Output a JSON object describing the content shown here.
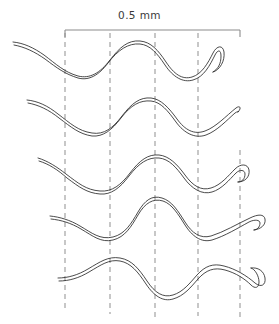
{
  "figure": {
    "name": "undulating-filament-sequence",
    "background_color": "#ffffff",
    "width": 279,
    "height": 324,
    "scale_bar": {
      "label": "0.5 mm",
      "x_start": 65,
      "x_end": 240,
      "y": 30,
      "tick_length": 7,
      "color": "#8c8c8c",
      "label_color": "#3a3a3a"
    },
    "reference_lines": {
      "style": "dashed",
      "color": "#9a9a9a",
      "stroke_width": 1.1,
      "dash_pattern": "5,4",
      "lines": [
        {
          "name": "reference-line-1",
          "x": 65,
          "y_top": 33,
          "y_bottom": 308
        },
        {
          "name": "reference-line-2",
          "x": 110,
          "y_top": 33,
          "y_bottom": 314
        },
        {
          "name": "reference-line-3",
          "x": 155,
          "y_top": 33,
          "y_bottom": 318
        },
        {
          "name": "reference-line-4",
          "x": 198,
          "y_top": 33,
          "y_bottom": 316
        },
        {
          "name": "reference-line-5",
          "x": 240,
          "y_top": 150,
          "y_bottom": 320
        }
      ]
    },
    "filaments": {
      "stroke_color": "#2b2b2b",
      "stroke_width": 0.85,
      "count": 5,
      "description": "Five successive body postures of an undulating filament, each drawn as a double-outline ribbon with a tapered head at left and a hooked tail at right.",
      "rows": [
        {
          "name": "filament-row-1",
          "head_x": 13,
          "head_y": 42,
          "tail_x": 222,
          "tail_y": 70,
          "outer": "M13,42 C24,43 34,48 44,55 C56,64 64,72 78,76 C90,79 100,73 110,60 C120,47 128,40 140,41 C151,42 158,50 166,62 C174,74 182,80 192,77 C202,74 208,63 213,53 C217,45 223,45 224,52 C225,61 220,70 213,72",
          "inner": "M14,45 C25,47 35,52 45,59 C57,68 65,74 78,78 C89,81 99,75 108,63 C118,50 128,43 140,44 C150,45 157,53 165,65 C173,77 183,83 193,80 C204,77 210,65 215,55 C218,49 221,50 221,56 C221,64 218,69 213,72"
        },
        {
          "name": "filament-row-2",
          "head_x": 27,
          "head_y": 100,
          "tail_x": 238,
          "tail_y": 111,
          "outer": "M27,100 C38,101 48,106 58,114 C70,123 78,131 92,133 C104,135 113,128 122,116 C132,103 140,97 151,98 C161,99 169,108 177,119 C185,130 194,135 205,131 C216,127 226,116 236,108 C240,105 242,108 238,112",
          "inner": "M28,103 C39,105 49,110 59,118 C71,127 79,134 92,136 C103,137 112,130 121,118 C131,105 140,100 151,101 C161,102 168,111 176,122 C184,133 195,139 206,135 C217,131 227,120 235,113 C238,111 240,111 238,112"
        },
        {
          "name": "filament-row-3",
          "head_x": 38,
          "head_y": 158,
          "tail_x": 248,
          "tail_y": 172,
          "outer": "M38,158 C48,161 57,167 66,174 C78,183 86,190 100,191 C112,192 121,185 130,173 C140,160 148,154 159,155 C169,156 177,164 185,175 C193,186 201,191 211,188 C221,185 228,176 235,169 C241,163 248,164 249,170 C250,177 245,182 238,182",
          "inner": "M39,161 C49,164 58,170 67,178 C79,187 87,193 100,194 C111,195 120,188 129,176 C139,163 148,157 159,158 C169,159 176,167 184,178 C192,189 202,195 212,192 C222,189 229,180 236,173 C240,169 245,170 245,174 C245,179 242,182 238,182"
        },
        {
          "name": "filament-row-4",
          "head_x": 50,
          "head_y": 216,
          "tail_x": 266,
          "tail_y": 220,
          "outer": "M50,216 C60,217 70,220 80,226 C92,233 100,240 113,237 C125,234 131,224 138,212 C145,200 152,195 162,198 C172,201 178,211 185,222 C192,233 200,239 211,236 C224,232 237,224 250,218 C258,214 264,214 265,219 C266,225 261,229 254,230",
          "inner": "M51,219 C61,220 71,223 81,229 C93,236 101,243 113,240 C125,237 131,227 138,215 C145,203 153,198 163,201 C172,204 178,214 185,225 C192,236 201,243 212,240 C225,236 238,228 249,222 C255,219 260,220 260,223 C260,227 257,230 254,230"
        },
        {
          "name": "filament-row-5",
          "head_x": 58,
          "head_y": 278,
          "tail_x": 264,
          "tail_y": 275,
          "outer": "M58,278 C68,278 78,275 88,269 C100,262 108,256 120,258 C132,260 139,269 147,281 C155,293 163,298 173,295 C183,292 190,283 197,275 C205,266 213,263 224,266 C236,269 247,276 255,283 C261,288 266,285 265,278 C264,271 258,267 251,268",
          "inner": "M59,281 C69,281 79,278 89,272 C101,265 109,259 120,261 C131,263 138,272 146,284 C154,296 163,302 173,299 C184,296 191,287 198,279 C206,270 214,267 225,270 C236,273 245,279 251,285 C255,289 259,288 259,282 C259,276 255,269 251,268"
        }
      ]
    }
  }
}
